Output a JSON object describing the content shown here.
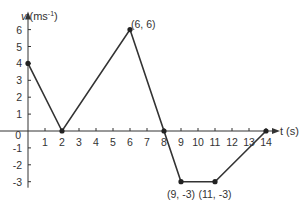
{
  "chart_data": {
    "type": "line",
    "title": "",
    "xlabel": "t (s)",
    "ylabel": "v (ms⁻¹)",
    "xlim": [
      0,
      14
    ],
    "ylim": [
      -3,
      6
    ],
    "x_ticks": [
      1,
      2,
      3,
      4,
      5,
      6,
      7,
      8,
      9,
      10,
      11,
      12,
      13,
      14
    ],
    "y_ticks": [
      -3,
      -2,
      -1,
      0,
      1,
      2,
      3,
      4,
      5,
      6
    ],
    "grid": false,
    "series": [
      {
        "name": "velocity",
        "x": [
          0,
          2,
          6,
          8,
          9,
          11,
          14
        ],
        "y": [
          4,
          0,
          6,
          0,
          -3,
          -3,
          0
        ]
      }
    ],
    "annotations": [
      {
        "text": "(6, 6)",
        "x": 6,
        "y": 6
      },
      {
        "text": "(9, -3)",
        "x": 9,
        "y": -3
      },
      {
        "text": "(11, -3)",
        "x": 11,
        "y": -3
      }
    ]
  },
  "labels": {
    "y_axis_v": "v",
    "y_axis_unit": "(ms",
    "y_axis_exp": "-1",
    "y_axis_close": ")",
    "x_axis": "t (s)"
  }
}
